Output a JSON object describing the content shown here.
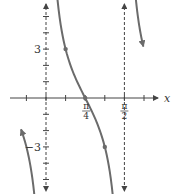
{
  "chart_data": {
    "type": "line",
    "title": "",
    "function": "y = 3 cot(2x)",
    "xlabel": "x",
    "ylabel": "",
    "xlim": [
      -0.589,
      0.6545
    ],
    "ylim": [
      -5.9,
      6.0
    ],
    "x_tick_step": 0.3927,
    "y_tick_step": 1,
    "x_tick_labels": [
      {
        "value": 0.7854,
        "numerator": "π",
        "denominator": "4"
      },
      {
        "value": 1.5708,
        "numerator": "π",
        "denominator": "2"
      }
    ],
    "y_tick_labels": [
      {
        "value": 3,
        "text": "3"
      },
      {
        "value": -3,
        "text": "−3"
      }
    ],
    "asymptotes": [
      0,
      1.5708
    ],
    "marked_points": [
      {
        "x": 0.3927,
        "y": 3
      },
      {
        "x": 0.7854,
        "y": 0
      },
      {
        "x": 1.1781,
        "y": -3
      }
    ],
    "series": [
      {
        "name": "branch-left",
        "x_range": [
          -0.5,
          -0.17
        ]
      },
      {
        "name": "branch-middle",
        "x_range": [
          0.17,
          1.4
        ]
      },
      {
        "name": "branch-right",
        "x_range": [
          1.74,
          1.95
        ]
      }
    ],
    "colors": {
      "curve": "#6b6b6b",
      "axis": "#444444"
    },
    "grid": false
  }
}
